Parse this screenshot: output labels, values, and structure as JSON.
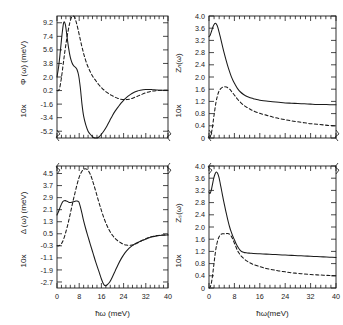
{
  "figure": {
    "background": "#ffffff",
    "ink": "#1a1a1a",
    "xlabel_left": "ħω (meV)",
    "xlabel_right": "ħω(meV)"
  },
  "chart_data": [
    {
      "id": "phi",
      "position": "top-left",
      "type": "line",
      "title": "",
      "xlabel": "",
      "ylabel": "10x  Φ(ω) (meV)",
      "ylabel_prefix": "10x",
      "ylabel_main": "Φ (ω)  (meV)",
      "xlim": [
        0,
        40
      ],
      "ylim": [
        -6.1,
        10.1
      ],
      "xticks": [
        0,
        8,
        16,
        24,
        32,
        40
      ],
      "xticklabels": [
        "",
        "",
        "",
        "",
        "",
        ""
      ],
      "xminor_count": 4,
      "yticks": [
        9.2,
        7.4,
        5.6,
        3.8,
        2.0,
        0.2,
        -1.6,
        -3.4,
        -5.2
      ],
      "yticklabels": [
        "9.2",
        "7.4",
        "5.6",
        "3.8",
        "2.0",
        "0.2",
        "-1.6",
        "-3.4",
        "-5.2"
      ],
      "grid": false,
      "legend": "none",
      "series": [
        {
          "name": "solid",
          "style": "solid",
          "x": [
            0.0,
            0.6,
            1.2,
            1.8,
            2.4,
            3.0,
            3.6,
            4.2,
            4.8,
            5.4,
            6.0,
            6.6,
            7.2,
            7.8,
            8.4,
            9.0,
            9.6,
            10.4,
            11.2,
            12.0,
            13.0,
            14.0,
            15.0,
            16.0,
            17.0,
            18.0,
            19.0,
            20.0,
            21.0,
            22.0,
            23.0,
            24.0,
            25.0,
            26.0,
            27.0,
            28.0,
            29.0,
            30.0,
            31.0,
            32.0,
            33.0,
            34.0,
            35.0,
            36.0,
            38.0,
            40.0
          ],
          "y": [
            2.0,
            3.4,
            5.4,
            7.6,
            9.2,
            9.0,
            7.4,
            5.8,
            4.6,
            3.9,
            3.5,
            3.3,
            3.0,
            2.2,
            0.6,
            -1.6,
            -3.2,
            -4.4,
            -5.2,
            -5.6,
            -6.0,
            -6.1,
            -6.0,
            -5.6,
            -5.1,
            -4.5,
            -3.8,
            -3.1,
            -2.5,
            -2.0,
            -1.5,
            -1.1,
            -0.75,
            -0.45,
            -0.2,
            0.0,
            0.15,
            0.25,
            0.32,
            0.35,
            0.35,
            0.33,
            0.3,
            0.28,
            0.25,
            0.25
          ]
        },
        {
          "name": "dashed",
          "style": "dashed",
          "x": [
            0.0,
            0.5,
            1.0,
            1.6,
            2.2,
            2.8,
            3.4,
            4.0,
            4.6,
            5.2,
            5.8,
            6.4,
            7.0,
            7.6,
            8.2,
            8.8,
            9.4,
            10.0,
            10.8,
            11.6,
            12.4,
            13.2,
            14.0,
            15.0,
            16.0,
            17.0,
            18.0,
            19.0,
            20.0,
            21.0,
            22.0,
            23.0,
            24.0,
            25.0,
            26.0,
            27.0,
            28.0,
            29.0,
            30.0,
            32.0,
            34.0,
            36.0,
            38.0,
            40.0
          ],
          "y": [
            0.2,
            0.2,
            0.6,
            1.9,
            3.6,
            5.3,
            6.8,
            8.1,
            9.2,
            9.9,
            10.1,
            9.9,
            9.2,
            8.3,
            7.3,
            6.3,
            5.4,
            4.6,
            3.7,
            3.0,
            2.4,
            1.9,
            1.5,
            1.0,
            0.6,
            0.25,
            -0.05,
            -0.3,
            -0.5,
            -0.7,
            -0.85,
            -0.95,
            -1.0,
            -1.0,
            -0.95,
            -0.85,
            -0.7,
            -0.55,
            -0.4,
            -0.1,
            0.1,
            0.2,
            0.25,
            0.25
          ]
        }
      ]
    },
    {
      "id": "zn",
      "position": "top-right",
      "type": "line",
      "title": "",
      "xlabel": "",
      "ylabel": "10x  Zₙ(ω)",
      "ylabel_prefix": "10x",
      "ylabel_main": "Zₙ(ω)",
      "xlim": [
        0,
        40
      ],
      "ylim": [
        0,
        4.0
      ],
      "xticks": [
        0,
        8,
        16,
        24,
        32,
        40
      ],
      "xticklabels": [
        "",
        "",
        "",
        "",
        "",
        ""
      ],
      "xminor_count": 4,
      "yticks": [
        4.0,
        3.6,
        3.2,
        2.8,
        2.4,
        2.0,
        1.6,
        1.2,
        0.8,
        0.4,
        0.0
      ],
      "yticklabels": [
        "4.0",
        "3.6",
        "3.2",
        "2.8",
        "2.4",
        "2.0",
        "1.6",
        "1.2",
        "0.8",
        "0.4",
        "0"
      ],
      "grid": false,
      "legend": "none",
      "series": [
        {
          "name": "solid",
          "style": "solid",
          "x": [
            0.0,
            0.4,
            0.8,
            1.2,
            1.6,
            2.0,
            2.4,
            2.8,
            3.2,
            3.6,
            4.0,
            4.6,
            5.2,
            5.8,
            6.4,
            7.0,
            7.6,
            8.2,
            9.0,
            10.0,
            11.0,
            12.0,
            13.0,
            14.0,
            15.0,
            16.0,
            18.0,
            20.0,
            22.0,
            24.0,
            26.0,
            28.0,
            30.0,
            32.0,
            34.0,
            36.0,
            38.0,
            40.0
          ],
          "y": [
            3.32,
            3.38,
            3.5,
            3.63,
            3.72,
            3.76,
            3.72,
            3.62,
            3.46,
            3.3,
            3.12,
            2.86,
            2.62,
            2.4,
            2.2,
            2.02,
            1.88,
            1.76,
            1.62,
            1.5,
            1.42,
            1.36,
            1.32,
            1.29,
            1.26,
            1.24,
            1.21,
            1.19,
            1.17,
            1.15,
            1.14,
            1.13,
            1.12,
            1.11,
            1.1,
            1.1,
            1.09,
            1.09
          ]
        },
        {
          "name": "dashed",
          "style": "dashed",
          "x": [
            0.0,
            0.3,
            0.6,
            1.0,
            1.4,
            1.8,
            2.2,
            2.6,
            3.0,
            3.4,
            3.8,
            4.2,
            4.6,
            5.0,
            5.5,
            6.0,
            6.5,
            7.0,
            7.6,
            8.2,
            9.0,
            10.0,
            11.0,
            12.0,
            13.0,
            14.0,
            16.0,
            18.0,
            20.0,
            22.0,
            24.0,
            26.0,
            28.0,
            30.0,
            32.0,
            34.0,
            36.0,
            38.0,
            40.0
          ],
          "y": [
            0.0,
            0.02,
            0.1,
            0.3,
            0.6,
            0.9,
            1.17,
            1.36,
            1.5,
            1.58,
            1.63,
            1.66,
            1.68,
            1.68,
            1.67,
            1.64,
            1.6,
            1.54,
            1.46,
            1.38,
            1.27,
            1.16,
            1.07,
            1.0,
            0.94,
            0.89,
            0.81,
            0.75,
            0.69,
            0.64,
            0.6,
            0.56,
            0.53,
            0.5,
            0.47,
            0.45,
            0.43,
            0.41,
            0.4
          ]
        }
      ]
    },
    {
      "id": "delta",
      "position": "bottom-left",
      "type": "line",
      "title": "",
      "xlabel": "ħω (meV)",
      "ylabel": "10x  Δ(ω) (meV)",
      "ylabel_prefix": "10x",
      "ylabel_main": "Δ (ω)  (meV)",
      "xlim": [
        0,
        40
      ],
      "ylim": [
        -3.1,
        5.0
      ],
      "xticks": [
        0,
        8,
        16,
        24,
        32,
        40
      ],
      "xticklabels": [
        "0",
        "8",
        "16",
        "24",
        "32",
        "40"
      ],
      "xminor_count": 4,
      "yticks": [
        4.5,
        3.7,
        2.9,
        2.1,
        1.3,
        0.5,
        -0.3,
        -1.1,
        -1.9,
        -2.7
      ],
      "yticklabels": [
        "4.5",
        "3.7",
        "2.9",
        "2.1",
        "1.3",
        "0.5",
        "-0.3",
        "-1.1",
        "-1.9",
        "-2.7"
      ],
      "grid": false,
      "legend": "none",
      "series": [
        {
          "name": "solid",
          "style": "solid",
          "x": [
            0.0,
            0.6,
            1.2,
            1.8,
            2.4,
            3.0,
            3.6,
            4.2,
            4.8,
            5.4,
            6.0,
            6.6,
            7.2,
            7.8,
            8.0,
            8.4,
            9.0,
            9.6,
            10.4,
            11.2,
            12.0,
            13.0,
            14.0,
            15.0,
            16.0,
            16.8,
            17.4,
            18.0,
            19.0,
            20.0,
            21.0,
            22.0,
            23.0,
            24.0,
            25.0,
            26.0,
            27.0,
            28.0,
            29.0,
            30.0,
            31.0,
            32.0,
            33.0,
            34.0,
            36.0,
            38.0,
            40.0
          ],
          "y": [
            1.75,
            2.0,
            2.3,
            2.55,
            2.68,
            2.7,
            2.66,
            2.6,
            2.58,
            2.6,
            2.63,
            2.66,
            2.68,
            2.63,
            2.55,
            2.3,
            1.85,
            1.35,
            0.8,
            0.3,
            -0.2,
            -0.8,
            -1.4,
            -1.95,
            -2.5,
            -2.85,
            -2.95,
            -2.9,
            -2.7,
            -2.35,
            -1.95,
            -1.55,
            -1.2,
            -0.9,
            -0.65,
            -0.45,
            -0.3,
            -0.18,
            -0.08,
            0.0,
            0.08,
            0.15,
            0.22,
            0.28,
            0.36,
            0.4,
            0.42
          ]
        },
        {
          "name": "dashed",
          "style": "dashed",
          "x": [
            0.0,
            0.6,
            1.2,
            1.8,
            2.4,
            3.0,
            3.6,
            4.2,
            4.8,
            5.4,
            6.0,
            6.6,
            7.2,
            7.8,
            8.4,
            9.0,
            9.6,
            10.2,
            10.8,
            11.4,
            12.0,
            12.6,
            13.2,
            14.0,
            15.0,
            16.0,
            17.0,
            18.0,
            19.0,
            20.0,
            21.0,
            22.0,
            23.0,
            24.0,
            25.0,
            26.0,
            27.0,
            28.0,
            29.0,
            30.0,
            31.0,
            32.0,
            33.0,
            34.0,
            36.0,
            38.0,
            40.0
          ],
          "y": [
            -0.3,
            -0.3,
            -0.25,
            -0.1,
            0.15,
            0.5,
            0.9,
            1.35,
            1.85,
            2.35,
            2.85,
            3.3,
            3.75,
            4.15,
            4.45,
            4.65,
            4.78,
            4.82,
            4.78,
            4.65,
            4.45,
            4.15,
            3.8,
            3.3,
            2.65,
            2.05,
            1.5,
            1.05,
            0.68,
            0.4,
            0.18,
            0.02,
            -0.1,
            -0.2,
            -0.25,
            -0.27,
            -0.25,
            -0.2,
            -0.12,
            -0.02,
            0.08,
            0.17,
            0.25,
            0.3,
            0.38,
            0.42,
            0.44
          ]
        }
      ]
    },
    {
      "id": "zs",
      "position": "bottom-right",
      "type": "line",
      "title": "",
      "xlabel": "ħω(meV)",
      "ylabel": "10x  Zₛ(ω)",
      "ylabel_prefix": "10x",
      "ylabel_main": "Zₛ(ω)",
      "xlim": [
        0,
        40
      ],
      "ylim": [
        0,
        4.0
      ],
      "xticks": [
        0,
        8,
        16,
        24,
        32,
        40
      ],
      "xticklabels": [
        "0",
        "8",
        "16",
        "24",
        "32",
        "40"
      ],
      "xminor_count": 4,
      "yticks": [
        4.0,
        3.6,
        3.2,
        2.8,
        2.4,
        2.0,
        1.6,
        1.2,
        0.8,
        0.4,
        0.0
      ],
      "yticklabels": [
        "4.0",
        "3.6",
        "3.2",
        "2.8",
        "2.4",
        "2.0",
        "1.6",
        "1.2",
        "0.8",
        "0.4",
        "0"
      ],
      "grid": false,
      "legend": "none",
      "series": [
        {
          "name": "solid",
          "style": "solid",
          "x": [
            0.0,
            0.3,
            0.7,
            1.1,
            1.5,
            1.9,
            2.3,
            2.7,
            3.1,
            3.4,
            3.7,
            4.0,
            4.4,
            4.8,
            5.2,
            5.6,
            6.0,
            6.5,
            7.0,
            7.5,
            8.0,
            8.5,
            9.0,
            9.5,
            10.0,
            10.6,
            11.2,
            12.0,
            13.0,
            14.0,
            16.0,
            18.0,
            20.0,
            22.0,
            24.0,
            26.0,
            28.0,
            30.0,
            32.0,
            34.0,
            36.0,
            38.0,
            40.0
          ],
          "y": [
            3.15,
            3.1,
            3.2,
            3.4,
            3.6,
            3.74,
            3.8,
            3.76,
            3.64,
            3.5,
            3.34,
            3.18,
            2.96,
            2.76,
            2.56,
            2.38,
            2.2,
            2.0,
            1.84,
            1.7,
            1.58,
            1.46,
            1.36,
            1.28,
            1.22,
            1.18,
            1.16,
            1.15,
            1.14,
            1.13,
            1.12,
            1.11,
            1.1,
            1.09,
            1.08,
            1.07,
            1.06,
            1.05,
            1.04,
            1.03,
            1.02,
            1.01,
            1.0
          ]
        },
        {
          "name": "dashed",
          "style": "dashed",
          "x": [
            0.0,
            0.3,
            0.6,
            1.0,
            1.4,
            1.8,
            2.2,
            2.6,
            3.0,
            3.4,
            3.8,
            4.2,
            4.6,
            5.0,
            5.4,
            5.8,
            6.2,
            6.6,
            7.0,
            7.4,
            7.8,
            8.2,
            8.6,
            9.0,
            9.5,
            10.0,
            11.0,
            12.0,
            13.0,
            14.0,
            16.0,
            18.0,
            20.0,
            22.0,
            24.0,
            26.0,
            28.0,
            30.0,
            32.0,
            34.0,
            36.0,
            38.0,
            40.0
          ],
          "y": [
            0.0,
            0.02,
            0.1,
            0.32,
            0.65,
            1.0,
            1.3,
            1.5,
            1.64,
            1.72,
            1.76,
            1.78,
            1.78,
            1.77,
            1.78,
            1.79,
            1.78,
            1.75,
            1.7,
            1.62,
            1.52,
            1.42,
            1.32,
            1.22,
            1.14,
            1.06,
            0.96,
            0.88,
            0.82,
            0.77,
            0.7,
            0.64,
            0.6,
            0.56,
            0.53,
            0.5,
            0.48,
            0.46,
            0.44,
            0.43,
            0.42,
            0.41,
            0.4
          ]
        }
      ]
    }
  ]
}
